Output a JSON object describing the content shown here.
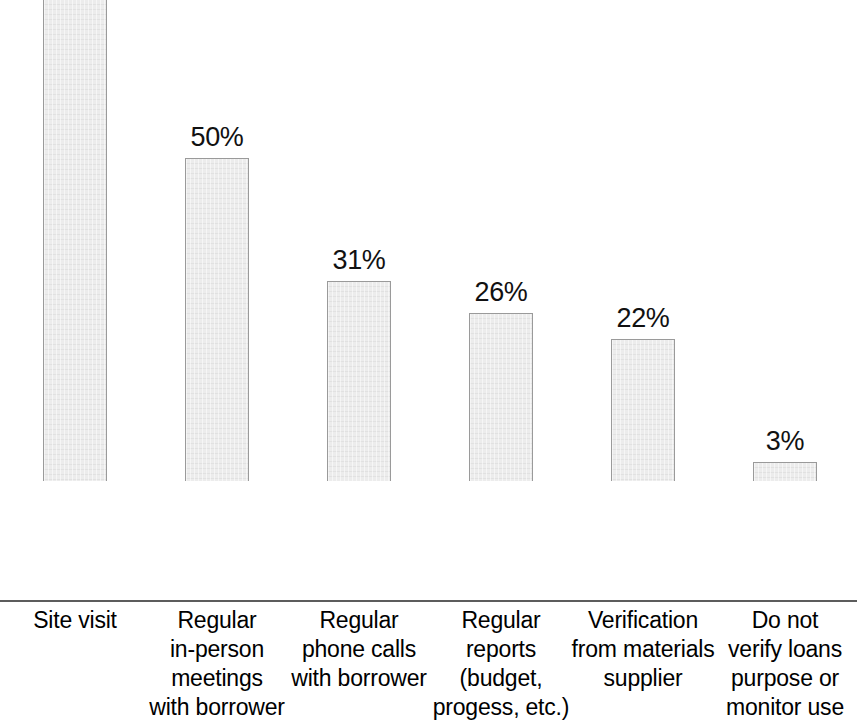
{
  "chart_data": {
    "type": "bar",
    "title": "",
    "subtitle": "",
    "xlabel": "",
    "ylabel": "",
    "ylim": [
      0,
      100
    ],
    "grid": false,
    "legend": false,
    "legend_position": "none",
    "axis": {
      "y_visible": false,
      "x_visible": true,
      "x_tick_labels_visible": true,
      "y_tick_labels": []
    },
    "value_label_suffix": "%",
    "categories": [
      "Site visit",
      "Regular in-person meetings with borrower",
      "Regular phone calls with borrower",
      "Regular reports (budget, progess, etc.)",
      "Verification from materials supplier",
      "Do not verify loans purpose or monitor use"
    ],
    "category_lines": [
      [
        "Site visit"
      ],
      [
        "Regular",
        "in-person",
        "meetings",
        "with borrower"
      ],
      [
        "Regular",
        "phone calls",
        "with borrower"
      ],
      [
        "Regular",
        "reports",
        "(budget,",
        "progess, etc.)"
      ],
      [
        "Verification",
        "from materials",
        "supplier"
      ],
      [
        "Do not",
        "verify loans",
        "purpose or",
        "monitor use"
      ]
    ],
    "values": [
      87,
      50,
      31,
      26,
      22,
      3
    ],
    "value_labels": [
      "87%",
      "50%",
      "31%",
      "26%",
      "22%",
      "3%"
    ],
    "colors": {
      "bar_fill": "#ececec",
      "bar_border": "#9a9a9a",
      "axis_line": "#5c5c5c",
      "text": "#000000",
      "background": "#ffffff"
    }
  }
}
